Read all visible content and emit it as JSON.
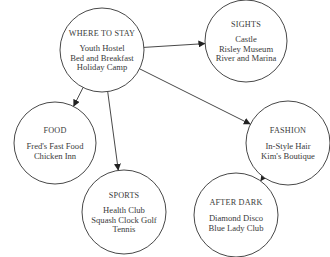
{
  "diagram": {
    "type": "mind-map",
    "colors": {
      "stroke": "#333333",
      "text": "#3a3a3a",
      "background": "#ffffff"
    },
    "nodes": [
      {
        "id": "stay",
        "title": "WHERE TO STAY",
        "items": [
          "Youth Hostel",
          "Bed and Breakfast",
          "Holiday Camp"
        ],
        "cx": 102,
        "cy": 50,
        "r": 42
      },
      {
        "id": "sights",
        "title": "SIGHTS",
        "items": [
          "Castle",
          "Risley Museum",
          "River and Marina"
        ],
        "cx": 246,
        "cy": 41,
        "r": 41
      },
      {
        "id": "food",
        "title": "FOOD",
        "items": [
          "Fred's Fast Food",
          "Chicken Inn"
        ],
        "cx": 55,
        "cy": 143,
        "r": 41
      },
      {
        "id": "fashion",
        "title": "FASHION",
        "items": [
          "In-Style Hair",
          "Kim's Boutique"
        ],
        "cx": 288,
        "cy": 143,
        "r": 42
      },
      {
        "id": "sports",
        "title": "SPORTS",
        "items": [
          "Health Club",
          "Squash  Clock Golf",
          "Tennis"
        ],
        "cx": 124,
        "cy": 212,
        "r": 42
      },
      {
        "id": "afterdark",
        "title": "AFTER DARK",
        "items": [
          "Diamond Disco",
          "Blue Lady Club"
        ],
        "cx": 236,
        "cy": 215,
        "r": 42
      }
    ],
    "edges": [
      {
        "from": "stay",
        "to": "sights"
      },
      {
        "from": "stay",
        "to": "food"
      },
      {
        "from": "stay",
        "to": "sports"
      },
      {
        "from": "stay",
        "to": "fashion"
      },
      {
        "from": "fashion",
        "to": "afterdark"
      }
    ]
  }
}
